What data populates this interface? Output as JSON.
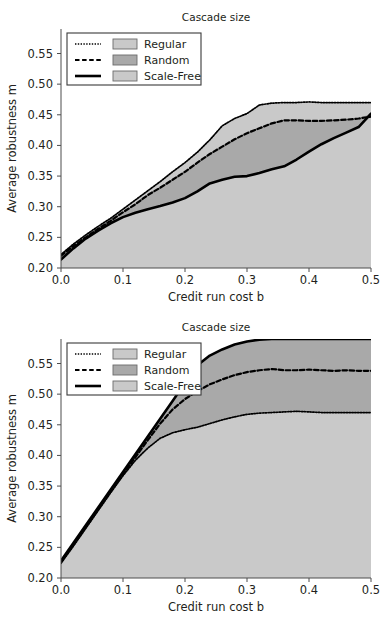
{
  "figure": {
    "panel_count": 2
  },
  "colors": {
    "regular_fill": "#c9c9c9",
    "random_fill": "#a9a9a9",
    "scalefree_fill": "#c9c9c9",
    "line": "#000000",
    "axis": "#4d4d4d",
    "background": "#ffffff",
    "legend_patch_light": "#c9c9c9",
    "legend_patch_dark": "#a9a9a9"
  },
  "legend": {
    "entries": [
      {
        "label": "Regular",
        "line_style": "dotted",
        "patch": "#c9c9c9"
      },
      {
        "label": "Random",
        "line_style": "dashed",
        "patch": "#a9a9a9"
      },
      {
        "label": "Scale-Free",
        "line_style": "solid",
        "patch": "#c9c9c9"
      }
    ]
  },
  "chart_data": [
    {
      "type": "area",
      "panel": "top",
      "title": "Cascade size",
      "xlabel": "Credit run cost b",
      "ylabel": "Average robustness m",
      "xlim": [
        0.0,
        0.5
      ],
      "ylim": [
        0.2,
        0.59
      ],
      "xticks": [
        0.0,
        0.1,
        0.2,
        0.3,
        0.4,
        0.5
      ],
      "xticklabels": [
        "0.0",
        "0.1",
        "0.2",
        "0.3",
        "0.4",
        "0.5"
      ],
      "yticks": [
        0.2,
        0.25,
        0.3,
        0.35,
        0.4,
        0.45,
        0.5,
        0.55
      ],
      "yticklabels": [
        "0.20",
        "0.25",
        "0.30",
        "0.35",
        "0.40",
        "0.45",
        "0.50",
        "0.55"
      ],
      "grid": false,
      "legend_position": "upper left",
      "x": [
        0.0,
        0.02,
        0.04,
        0.06,
        0.08,
        0.1,
        0.12,
        0.14,
        0.16,
        0.18,
        0.2,
        0.22,
        0.24,
        0.26,
        0.28,
        0.3,
        0.32,
        0.34,
        0.36,
        0.38,
        0.4,
        0.42,
        0.44,
        0.46,
        0.48,
        0.5
      ],
      "series": [
        {
          "name": "Regular",
          "line_style": "dotted",
          "values": [
            0.222,
            0.239,
            0.254,
            0.268,
            0.281,
            0.296,
            0.311,
            0.326,
            0.341,
            0.357,
            0.372,
            0.389,
            0.409,
            0.432,
            0.444,
            0.452,
            0.466,
            0.469,
            0.47,
            0.47,
            0.471,
            0.47,
            0.47,
            0.47,
            0.47,
            0.47
          ]
        },
        {
          "name": "Random",
          "line_style": "dashed",
          "values": [
            0.22,
            0.236,
            0.25,
            0.264,
            0.277,
            0.291,
            0.304,
            0.319,
            0.331,
            0.344,
            0.357,
            0.372,
            0.386,
            0.398,
            0.41,
            0.42,
            0.428,
            0.436,
            0.441,
            0.441,
            0.44,
            0.44,
            0.441,
            0.442,
            0.444,
            0.447
          ]
        },
        {
          "name": "Scale-Free",
          "line_style": "solid",
          "values": [
            0.214,
            0.232,
            0.248,
            0.261,
            0.273,
            0.283,
            0.29,
            0.296,
            0.301,
            0.307,
            0.314,
            0.325,
            0.338,
            0.344,
            0.349,
            0.35,
            0.355,
            0.361,
            0.366,
            0.377,
            0.39,
            0.402,
            0.412,
            0.421,
            0.43,
            0.452
          ]
        }
      ]
    },
    {
      "type": "area",
      "panel": "bottom",
      "title": "Cascade size",
      "xlabel": "Credit run cost b",
      "ylabel": "Average robustness m",
      "xlim": [
        0.0,
        0.5
      ],
      "ylim": [
        0.2,
        0.59
      ],
      "xticks": [
        0.0,
        0.1,
        0.2,
        0.3,
        0.4,
        0.5
      ],
      "xticklabels": [
        "0.0",
        "0.1",
        "0.2",
        "0.3",
        "0.4",
        "0.5"
      ],
      "yticks": [
        0.2,
        0.25,
        0.3,
        0.35,
        0.4,
        0.45,
        0.5,
        0.55
      ],
      "yticklabels": [
        "0.20",
        "0.25",
        "0.30",
        "0.35",
        "0.40",
        "0.45",
        "0.50",
        "0.55"
      ],
      "grid": false,
      "legend_position": "upper left",
      "x": [
        0.0,
        0.02,
        0.04,
        0.06,
        0.08,
        0.1,
        0.12,
        0.14,
        0.16,
        0.18,
        0.2,
        0.22,
        0.24,
        0.26,
        0.28,
        0.3,
        0.32,
        0.34,
        0.36,
        0.38,
        0.4,
        0.42,
        0.44,
        0.46,
        0.48,
        0.5
      ],
      "series": [
        {
          "name": "Regular",
          "line_style": "dotted",
          "values": [
            0.224,
            0.252,
            0.281,
            0.31,
            0.339,
            0.367,
            0.392,
            0.412,
            0.428,
            0.437,
            0.442,
            0.446,
            0.452,
            0.458,
            0.463,
            0.467,
            0.469,
            0.47,
            0.471,
            0.472,
            0.471,
            0.47,
            0.47,
            0.47,
            0.47,
            0.47
          ]
        },
        {
          "name": "Random",
          "line_style": "dashed",
          "values": [
            0.226,
            0.254,
            0.283,
            0.312,
            0.341,
            0.369,
            0.397,
            0.425,
            0.452,
            0.475,
            0.492,
            0.505,
            0.516,
            0.524,
            0.531,
            0.536,
            0.539,
            0.541,
            0.539,
            0.539,
            0.54,
            0.539,
            0.538,
            0.539,
            0.538,
            0.538
          ]
        },
        {
          "name": "Scale-Free",
          "line_style": "solid",
          "values": [
            0.228,
            0.257,
            0.286,
            0.315,
            0.344,
            0.373,
            0.402,
            0.431,
            0.46,
            0.489,
            0.518,
            0.547,
            0.563,
            0.573,
            0.581,
            0.586,
            0.589,
            0.59,
            0.59,
            0.59,
            0.59,
            0.59,
            0.59,
            0.59,
            0.59,
            0.59
          ]
        }
      ]
    }
  ]
}
